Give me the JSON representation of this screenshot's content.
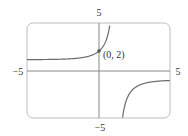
{
  "chart_data": {
    "type": "line",
    "title": "",
    "xlabel": "",
    "ylabel": "",
    "xlim": [
      -5,
      5
    ],
    "ylim": [
      -5,
      5
    ],
    "grid": false,
    "tick_labels": {
      "x_min": "−5",
      "x_max": "5",
      "y_min": "−5",
      "y_max": "5"
    },
    "annotations": [
      {
        "text": "(0, 2)",
        "x": 0,
        "y": 2
      }
    ],
    "function": {
      "description": "Rational-exponential curve with vertical asymptote near x≈1.25, horizontal asymptotes y≈1.14 (left) and y=−1 (right)",
      "form": "(a + e^x)/(b - e^x)",
      "a": 4,
      "b": 3.5
    },
    "series": [
      {
        "name": "f(x)",
        "branches": [
          {
            "x_range": [
              -5,
              0.75
            ],
            "description": "left branch rising from y≈1.14 through (0,2) to +∞"
          },
          {
            "x_range": [
              1.6,
              5
            ],
            "description": "right branch rising from −∞ toward y=−1"
          }
        ]
      }
    ],
    "colors": {
      "curve": "#6b6b6b",
      "axes": "#888888",
      "frame": "#bdbdbd",
      "point": "#555555"
    }
  }
}
